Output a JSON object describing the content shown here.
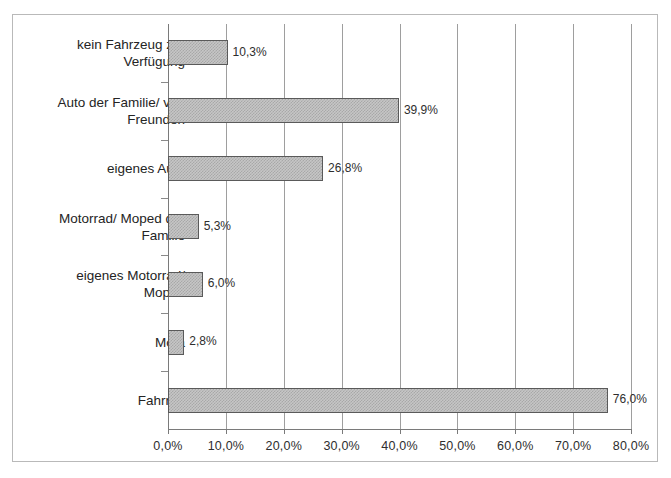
{
  "chart_data": {
    "type": "bar",
    "orientation": "horizontal",
    "title": "",
    "subtitle": "",
    "xlabel": "",
    "ylabel": "",
    "xlim": [
      0,
      80
    ],
    "grid": true,
    "legend": "none",
    "categories": [
      "kein Fahrzeug zur\nVerfügung",
      "Auto der Familie/ von\nFreunden",
      "eigenes Auto",
      "Motorrad/ Moped der\nFamilie",
      "eigenes Motorrad/\nMoped",
      "Mofa",
      "Fahrrad"
    ],
    "values": [
      10.3,
      39.9,
      26.8,
      5.3,
      6.0,
      2.8,
      76.0
    ],
    "value_labels": [
      "10,3%",
      "39,9%",
      "26,8%",
      "5,3%",
      "6,0%",
      "2,8%",
      "76,0%"
    ],
    "xticks": [
      0,
      10,
      20,
      30,
      40,
      50,
      60,
      70,
      80
    ],
    "xtick_labels": [
      "0,0%",
      "10,0%",
      "20,0%",
      "30,0%",
      "40,0%",
      "50,0%",
      "60,0%",
      "70,0%",
      "80,0%"
    ],
    "colors": {
      "bar_fill": "#c6c6c6",
      "bar_pattern": "#a8a8a8",
      "bar_border": "#5a5a5a",
      "gridline": "#9e9e9e",
      "axis": "#7a7a7a",
      "text": "#2b2b2b",
      "frame": "#b9b9b9",
      "background": "#ffffff"
    }
  }
}
